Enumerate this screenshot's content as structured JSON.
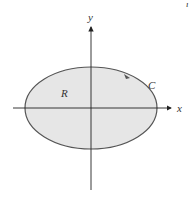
{
  "diagram": {
    "labels": {
      "y_axis": "y",
      "x_axis": "x",
      "region": "R",
      "curve": "C",
      "corner_fragment": "ı"
    },
    "colors": {
      "region_fill": "#e6e6e6",
      "curve_stroke": "#555555",
      "axis": "#222222",
      "background": "#ffffff"
    },
    "ellipse": {
      "cx": 91,
      "cy": 108,
      "rx": 66,
      "ry": 41
    },
    "curve_orientation": "counterclockwise"
  }
}
